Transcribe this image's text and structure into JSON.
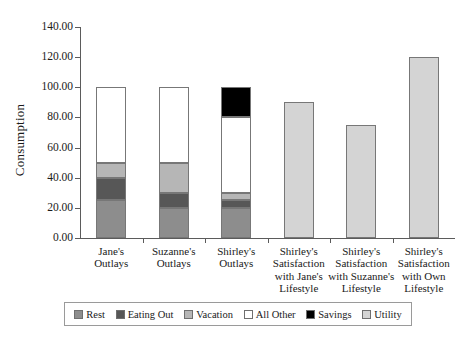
{
  "chart_data": {
    "type": "bar",
    "title": "",
    "subtitle": "",
    "xlabel": "",
    "ylabel": "Consumption",
    "ylim": [
      0,
      140
    ],
    "ytick_values": [
      0,
      20,
      40,
      60,
      80,
      100,
      120,
      140
    ],
    "ytick_labels": [
      "0.00",
      "20.00",
      "40.00",
      "60.00",
      "80.00",
      "100.00",
      "120.00",
      "140.00"
    ],
    "grid": false,
    "stacked": true,
    "legend_position": "bottom",
    "categories": [
      "Jane's\nOutlays",
      "Suzanne's\nOutlays",
      "Shirley's\nOutlays",
      "Shirley's\nSatisfaction\nwith Jane's\nLifestyle",
      "Shirley's\nSatisfaction\nwith Suzanne's\nLifestyle",
      "Shirley's\nSatisfaction\nwith Own\nLifestyle"
    ],
    "series": [
      {
        "name": "Rest",
        "color": "#8d8d8d",
        "values": [
          25,
          20,
          20,
          0,
          0,
          0
        ]
      },
      {
        "name": "Eating Out",
        "color": "#575757",
        "values": [
          15,
          10,
          5,
          0,
          0,
          0
        ]
      },
      {
        "name": "Vacation",
        "color": "#b6b6b6",
        "values": [
          10,
          20,
          5,
          0,
          0,
          0
        ]
      },
      {
        "name": "All Other",
        "color": "#ffffff",
        "values": [
          50,
          50,
          50,
          0,
          0,
          0
        ]
      },
      {
        "name": "Savings",
        "color": "#000000",
        "values": [
          0,
          0,
          20,
          0,
          0,
          0
        ]
      },
      {
        "name": "Utility",
        "color": "#d4d4d4",
        "values": [
          0,
          0,
          0,
          90,
          75,
          120
        ]
      }
    ],
    "totals": [
      100,
      100,
      100,
      90,
      75,
      120
    ]
  },
  "legend": {
    "items": [
      {
        "label": "Rest",
        "color": "#8d8d8d"
      },
      {
        "label": "Eating Out",
        "color": "#575757"
      },
      {
        "label": "Vacation",
        "color": "#b6b6b6"
      },
      {
        "label": "All Other",
        "color": "#ffffff"
      },
      {
        "label": "Savings",
        "color": "#000000"
      },
      {
        "label": "Utility",
        "color": "#d4d4d4"
      }
    ]
  }
}
